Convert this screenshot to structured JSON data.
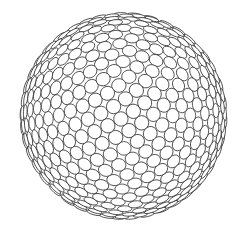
{
  "image": {
    "description": "Line-art sphere composed of densely packed small circles",
    "background": "#ffffff",
    "stroke_color": "#2a2a2a",
    "fill_color": "#ffffff"
  },
  "sphere": {
    "center_x": 123.5,
    "center_y": 116,
    "radius": 106,
    "circle_count": 620,
    "circle_radius": 7.2,
    "stroke_width": 0.75,
    "tilt_deg": 22,
    "spin_deg": 35
  }
}
